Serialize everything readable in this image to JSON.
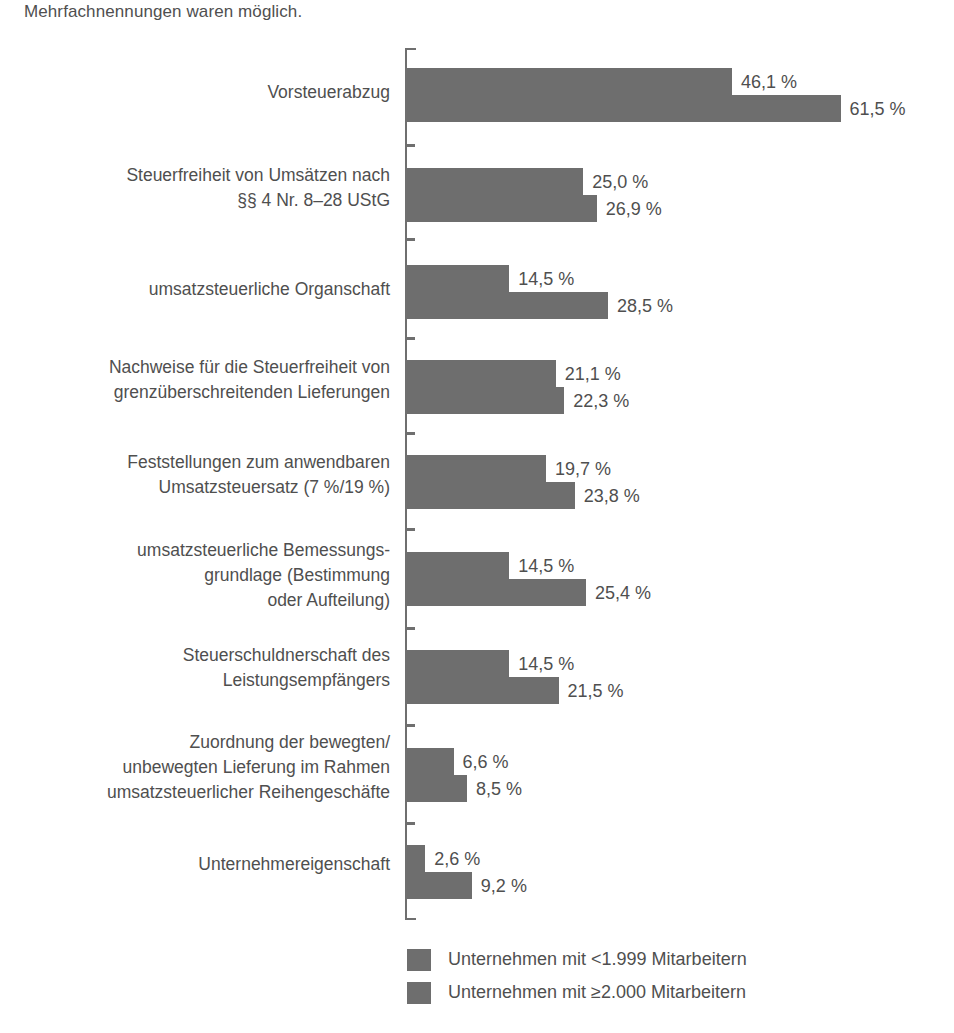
{
  "note": "Mehrfachnennungen waren möglich.",
  "chart_data": {
    "type": "bar",
    "orientation": "horizontal",
    "title": "",
    "subtitle": "Mehrfachnennungen waren möglich.",
    "xlabel": "",
    "ylabel": "",
    "grid": false,
    "axis_visible": true,
    "value_suffix": " %",
    "xlim": [
      0,
      70
    ],
    "legend_position": "bottom",
    "bar_color": "#6e6e6e",
    "text_color": "#4f4f4f",
    "categories": [
      "Vorsteuerabzug",
      "Steuerfreiheit von Umsätzen nach\n§§ 4 Nr. 8–28 UStG",
      "umsatzsteuerliche Organschaft",
      "Nachweise für die Steuerfreiheit von\ngrenzüberschreitenden Lieferungen",
      "Feststellungen zum anwendbaren\nUmsatzsteuersatz (7 %/19 %)",
      "umsatzsteuerliche Bemessungs-\ngrundlage (Bestimmung\noder Aufteilung)",
      "Steuerschuldnerschaft des\nLeistungsempfängers",
      "Zuordnung der bewegten/\nunbewegten Lieferung im Rahmen\numsatzsteuerlicher Reihengeschäfte",
      "Unternehmereigenschaft"
    ],
    "series": [
      {
        "name": "Unternehmen mit < 1.999 Mitarbeitern",
        "color": "#6e6e6e",
        "values": [
          46.1,
          25.0,
          14.5,
          21.1,
          19.7,
          14.5,
          14.5,
          6.6,
          2.6
        ],
        "labels": [
          "46,1 %",
          "25,0 %",
          "14,5 %",
          "21,1 %",
          "19,7 %",
          "14,5 %",
          "14,5 %",
          "6,6 %",
          "2,6 %"
        ]
      },
      {
        "name": "Unternehmen mit ≥ 2.000 Mitarbeitern",
        "color": "#6e6e6e",
        "values": [
          61.5,
          26.9,
          28.5,
          22.3,
          23.8,
          25.4,
          21.5,
          8.5,
          9.2
        ],
        "labels": [
          "61,5 %",
          "26,9 %",
          "28,5 %",
          "22,3 %",
          "23,8 %",
          "25,4 %",
          "21,5 %",
          "8,5 %",
          "9,2 %"
        ]
      }
    ],
    "legend": [
      "Unternehmen mit <1.999 Mitarbeitern",
      "Unternehmen mit ≥2.000 Mitarbeitern"
    ]
  },
  "layout": {
    "axis_x": 407,
    "px_per_percent": 7.05,
    "group_tops": [
      68,
      168,
      265,
      360,
      455,
      552,
      650,
      748,
      845
    ],
    "tick_ys": [
      144,
      238,
      337,
      432,
      528,
      627,
      724,
      822
    ],
    "label_tops": [
      80,
      163,
      277,
      355,
      450,
      538,
      643,
      730,
      852
    ]
  }
}
